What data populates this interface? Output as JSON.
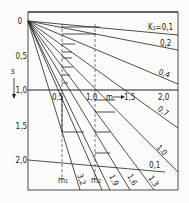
{
  "diagram": {
    "y_axis": {
      "label": "s",
      "arrow": "down-arrow",
      "ticks": [
        "0",
        "0,5",
        "1,0",
        "1,5",
        "2,0"
      ],
      "tick_values": [
        0,
        0.5,
        1.0,
        1.5,
        2.0
      ]
    },
    "x_axis": {
      "label": "m",
      "arrow": "right-arrow",
      "ticks": [
        "0,5",
        "1,0",
        "1,5",
        "2,0"
      ],
      "tick_values": [
        0.5,
        1.0,
        1.5,
        2.0
      ]
    },
    "parameter_name": "K1",
    "upper_family_labels": [
      "K₁=0,1",
      "0,2",
      "0,4",
      "0,7",
      "1,0"
    ],
    "upper_family_values": [
      0.1,
      0.2,
      0.4,
      0.7,
      1.0
    ],
    "lower_family_labels": [
      "1,3",
      "1,6",
      "1,9",
      "3,2"
    ],
    "lower_family_values": [
      1.3,
      1.6,
      1.9,
      3.2
    ],
    "bottom_line_label": "0,1",
    "markers": [
      "m₁",
      "m₂"
    ],
    "marker_values": [
      0.5,
      1.0
    ]
  }
}
